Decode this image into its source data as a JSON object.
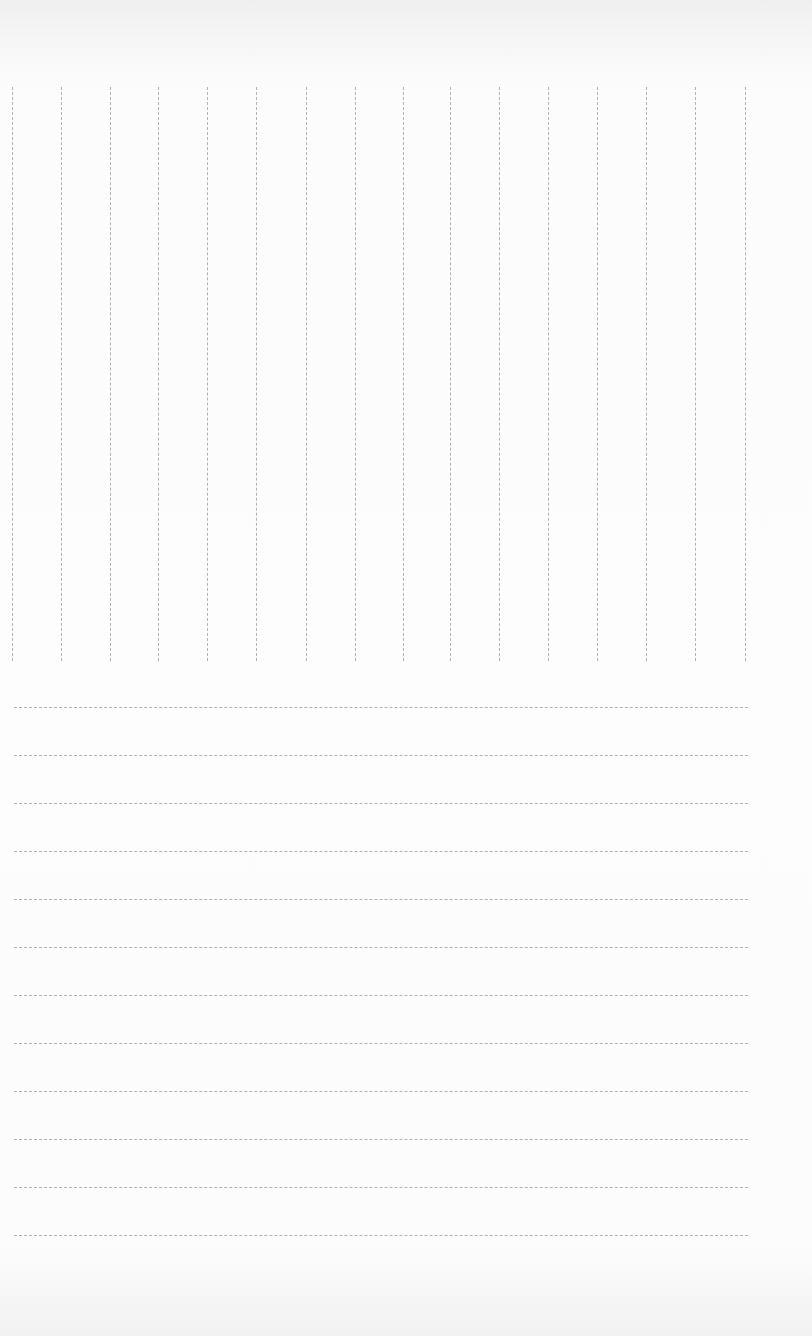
{
  "document": {
    "type": "blank ruled form",
    "colors": {
      "paper": "#fbfbfb",
      "line": "#9a9a9a"
    },
    "column_grid": {
      "top": 87,
      "bottom": 661,
      "column_line_x": [
        12,
        61,
        110,
        158,
        207,
        256,
        306,
        355,
        403,
        450,
        499,
        548,
        597,
        646,
        695,
        745
      ]
    },
    "ruled_lines": {
      "left": 14,
      "right": 748,
      "line_y": [
        707,
        755,
        803,
        851,
        899,
        947,
        995,
        1043,
        1091,
        1139,
        1187,
        1235
      ]
    }
  }
}
